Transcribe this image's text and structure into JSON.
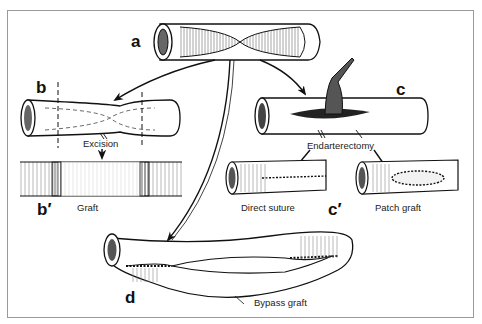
{
  "figure": {
    "panels": [
      {
        "id": "a",
        "label": "a",
        "description": "stenotic artery segment (cut-away)"
      },
      {
        "id": "b",
        "label": "b",
        "caption": "Excision"
      },
      {
        "id": "b_prime",
        "label": "b′",
        "caption": "Graft"
      },
      {
        "id": "c",
        "label": "c",
        "caption": "Endarterectomy"
      },
      {
        "id": "c_prime",
        "label": "c′",
        "captions": [
          "Direct suture",
          "Patch graft"
        ]
      },
      {
        "id": "d",
        "label": "d",
        "caption": "Bypass graft"
      }
    ]
  },
  "colors": {
    "frame": "#9a9a9a",
    "ink": "#111111",
    "shade": "#555555",
    "background": "#ffffff"
  }
}
